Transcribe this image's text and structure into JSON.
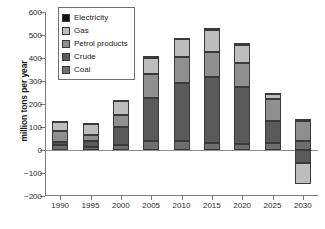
{
  "chart_data": {
    "type": "bar",
    "subtype": "stacked-bar-with-negatives",
    "title": "",
    "xlabel": "",
    "ylabel": "million tons per year",
    "categories": [
      "1990",
      "1995",
      "2000",
      "2005",
      "2010",
      "2015",
      "2020",
      "2025",
      "2030"
    ],
    "ylim": [
      -200,
      600
    ],
    "yticks": [
      -200,
      -100,
      0,
      100,
      200,
      300,
      400,
      500,
      600
    ],
    "ytick_labels": [
      "−200",
      "−100",
      "0",
      "100",
      "200",
      "300",
      "400",
      "500",
      "600"
    ],
    "grid": false,
    "legend_position": "top-left",
    "series": [
      {
        "name": "Coal",
        "color": "#6e6e6e",
        "values": [
          22,
          12,
          22,
          37,
          38,
          32,
          28,
          32,
          38
        ]
      },
      {
        "name": "Crude",
        "color": "#5a5a5a",
        "values": [
          12,
          28,
          78,
          190,
          255,
          285,
          248,
          95,
          -55
        ]
      },
      {
        "name": "Petrol products",
        "color": "#8f8f8f",
        "values": [
          47,
          25,
          52,
          105,
          110,
          110,
          103,
          93,
          90
        ]
      },
      {
        "name": "Gas",
        "color": "#bdbdbd",
        "values": [
          40,
          50,
          60,
          70,
          80,
          95,
          78,
          22,
          -95
        ]
      },
      {
        "name": "Electricity",
        "color": "#131313",
        "values": [
          4,
          4,
          4,
          6,
          6,
          8,
          7,
          6,
          5
        ]
      }
    ],
    "totals_positive": [
      125,
      119,
      216,
      405,
      489,
      530,
      464,
      248,
      133
    ],
    "annotations": []
  },
  "legend": {
    "items": [
      {
        "label": "Electricity",
        "color": "#131313"
      },
      {
        "label": "Gas",
        "color": "#bdbdbd"
      },
      {
        "label": "Petrol products",
        "color": "#8f8f8f"
      },
      {
        "label": "Crude",
        "color": "#5a5a5a"
      },
      {
        "label": "Coal",
        "color": "#6e6e6e"
      }
    ]
  },
  "style": {
    "axis_color": "#7a7a7a",
    "zero_line_color": "#8c8c8c",
    "segment_border": "#3a3a3a",
    "background": "#ffffff"
  }
}
